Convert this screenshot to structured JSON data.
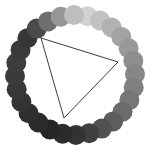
{
  "figure": {
    "background_color": "#ffffff",
    "width": 152,
    "height": 158
  },
  "chart_data": {
    "type": "scatter",
    "subtitle": "",
    "xlabel": "",
    "ylabel": "",
    "xlim": [
      0,
      152
    ],
    "ylim": [
      0,
      158
    ],
    "grid": false,
    "legend": null,
    "annotations": [],
    "ring": {
      "center_x": 75,
      "center_y": 75,
      "ring_radius": 60,
      "dot_radius": 10,
      "dot_count": 28,
      "start_angle_deg": -78,
      "direction": "clockwise",
      "colormap": "grayscale-cyclic",
      "description": "28 equally spaced filled circles on a ring; fill lightness peaks near the top and falls to near-black toward the bottom-left"
    },
    "series": [
      {
        "name": "ring-dots",
        "values": [
          {
            "index": 0,
            "angle_deg": -78.0,
            "cx": 87.5,
            "cy": 16.3,
            "color": "#d2d2d2",
            "gray": 210
          },
          {
            "index": 1,
            "angle_deg": -65.1,
            "cx": 100.1,
            "cy": 20.5,
            "color": "#c2c2c2",
            "gray": 194
          },
          {
            "index": 2,
            "angle_deg": -52.3,
            "cx": 111.7,
            "cy": 27.5,
            "color": "#b1b1b1",
            "gray": 177
          },
          {
            "index": 3,
            "angle_deg": -39.4,
            "cx": 121.3,
            "cy": 36.9,
            "color": "#a3a3a3",
            "gray": 163
          },
          {
            "index": 4,
            "angle_deg": -26.6,
            "cx": 128.6,
            "cy": 48.2,
            "color": "#999999",
            "gray": 153
          },
          {
            "index": 5,
            "angle_deg": -13.7,
            "cx": 133.3,
            "cy": 60.8,
            "color": "#8e8e8e",
            "gray": 142
          },
          {
            "index": 6,
            "angle_deg": -0.9,
            "cx": 135.0,
            "cy": 74.1,
            "color": "#878787",
            "gray": 135
          },
          {
            "index": 7,
            "angle_deg": 12.0,
            "cx": 133.7,
            "cy": 87.4,
            "color": "#808080",
            "gray": 128
          },
          {
            "index": 8,
            "angle_deg": 24.9,
            "cx": 129.4,
            "cy": 100.1,
            "color": "#767676",
            "gray": 118
          },
          {
            "index": 9,
            "angle_deg": 37.7,
            "cx": 122.5,
            "cy": 111.7,
            "color": "#6b6b6b",
            "gray": 107
          },
          {
            "index": 10,
            "angle_deg": 50.6,
            "cx": 113.1,
            "cy": 121.4,
            "color": "#5e5e5e",
            "gray": 94
          },
          {
            "index": 11,
            "angle_deg": 63.4,
            "cx": 101.8,
            "cy": 128.6,
            "color": "#505050",
            "gray": 80
          },
          {
            "index": 12,
            "angle_deg": 76.3,
            "cx": 89.2,
            "cy": 133.3,
            "color": "#404040",
            "gray": 64
          },
          {
            "index": 13,
            "angle_deg": 89.1,
            "cx": 75.9,
            "cy": 135.0,
            "color": "#333333",
            "gray": 51
          },
          {
            "index": 14,
            "angle_deg": 102.0,
            "cx": 62.6,
            "cy": 133.7,
            "color": "#2b2b2b",
            "gray": 43
          },
          {
            "index": 15,
            "angle_deg": 114.9,
            "cx": 49.8,
            "cy": 129.4,
            "color": "#262626",
            "gray": 38
          },
          {
            "index": 16,
            "angle_deg": 127.7,
            "cx": 38.3,
            "cy": 122.5,
            "color": "#2a2a2a",
            "gray": 42
          },
          {
            "index": 17,
            "angle_deg": 140.6,
            "cx": 28.6,
            "cy": 113.2,
            "color": "#2f2f2f",
            "gray": 47
          },
          {
            "index": 18,
            "angle_deg": 153.4,
            "cx": 21.4,
            "cy": 101.9,
            "color": "#343434",
            "gray": 52
          },
          {
            "index": 19,
            "angle_deg": 166.3,
            "cx": 16.7,
            "cy": 89.3,
            "color": "#383838",
            "gray": 56
          },
          {
            "index": 20,
            "angle_deg": 179.1,
            "cx": 15.0,
            "cy": 76.0,
            "color": "#3b3b3b",
            "gray": 59
          },
          {
            "index": 21,
            "angle_deg": 192.0,
            "cx": 16.3,
            "cy": 62.7,
            "color": "#3d3d3d",
            "gray": 61
          },
          {
            "index": 22,
            "angle_deg": 204.9,
            "cx": 20.5,
            "cy": 49.9,
            "color": "#3a3a3a",
            "gray": 58
          },
          {
            "index": 23,
            "angle_deg": 217.7,
            "cx": 27.4,
            "cy": 38.3,
            "color": "#363636",
            "gray": 54
          },
          {
            "index": 24,
            "angle_deg": 230.6,
            "cx": 36.8,
            "cy": 28.6,
            "color": "#4a4a4a",
            "gray": 74
          },
          {
            "index": 25,
            "angle_deg": 243.4,
            "cx": 48.1,
            "cy": 21.4,
            "color": "#6e6e6e",
            "gray": 110
          },
          {
            "index": 26,
            "angle_deg": 256.3,
            "cx": 60.7,
            "cy": 16.7,
            "color": "#969696",
            "gray": 150
          },
          {
            "index": 27,
            "angle_deg": 269.1,
            "cx": 74.0,
            "cy": 15.0,
            "color": "#bebebe",
            "gray": 190
          }
        ]
      },
      {
        "name": "triangle",
        "shape": "triangle",
        "fill": "none",
        "stroke_color": "#3c3c3c",
        "stroke_width": 1,
        "vertices": [
          {
            "label": "top-left",
            "x": 41,
            "y": 38
          },
          {
            "label": "right",
            "x": 118,
            "y": 62
          },
          {
            "label": "bottom",
            "x": 64,
            "y": 118
          }
        ]
      }
    ]
  }
}
